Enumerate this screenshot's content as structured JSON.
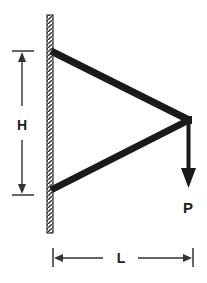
{
  "diagram": {
    "type": "two-bar truss bracket attached to wall",
    "labels": {
      "height": "H",
      "length": "L",
      "load": "P"
    },
    "colors": {
      "member": "#1a1a1a",
      "wall_hatch": "#333333",
      "dimension": "#333333"
    }
  }
}
